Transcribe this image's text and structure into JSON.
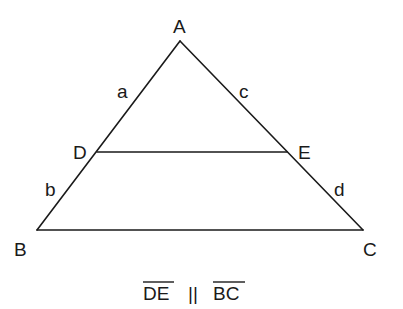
{
  "diagram": {
    "vertices": {
      "A": {
        "label": "A",
        "x": 180,
        "y": 41
      },
      "B": {
        "label": "B",
        "x": 37,
        "y": 230
      },
      "C": {
        "label": "C",
        "x": 363,
        "y": 230
      },
      "D": {
        "label": "D",
        "x": 97,
        "y": 152
      },
      "E": {
        "label": "E",
        "x": 287,
        "y": 152
      }
    },
    "segment_labels": {
      "a": {
        "label": "a",
        "segment": "AD"
      },
      "b": {
        "label": "b",
        "segment": "DB"
      },
      "c": {
        "label": "c",
        "segment": "AE"
      },
      "d": {
        "label": "d",
        "segment": "EC"
      }
    },
    "caption": {
      "left": "DE",
      "relation": "||",
      "right": "BC",
      "full": "DE || BC"
    },
    "colors": {
      "stroke": "#1a1a1a",
      "background": "#ffffff"
    }
  }
}
